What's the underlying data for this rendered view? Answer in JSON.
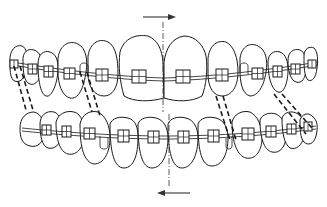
{
  "figure": {
    "title": "Orthodontic appliance with intermaxillary elastics and midline shift"
  },
  "colors": {
    "line": "#1a1a1a",
    "background": "#ffffff",
    "arrow": "#333333"
  },
  "annotations": {
    "upper_arrow": {
      "direction": "right",
      "meaning": "upper midline shift"
    },
    "lower_arrow": {
      "direction": "left",
      "meaning": "lower midline shift"
    },
    "midline": {
      "style": "dash-dot",
      "orientation": "vertical"
    }
  },
  "upper_arch": {
    "teeth_count": 12,
    "brackets_count": 12,
    "loops": [
      "left-canine-loop",
      "right-canine-loop"
    ]
  },
  "lower_arch": {
    "teeth_count": 12,
    "brackets_count": 12,
    "loops": [
      "left-canine-loop",
      "right-canine-loop"
    ]
  },
  "elastics": [
    {
      "side": "left",
      "position": "posterior"
    },
    {
      "side": "left",
      "position": "anterior"
    },
    {
      "side": "right",
      "position": "anterior"
    },
    {
      "side": "right",
      "position": "posterior"
    }
  ]
}
